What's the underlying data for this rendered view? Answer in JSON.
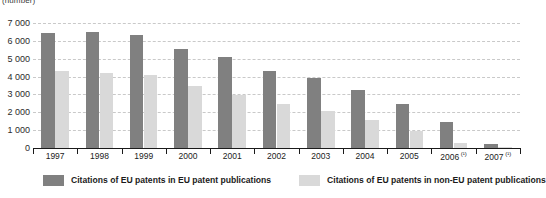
{
  "chart_data": {
    "type": "bar",
    "title": "",
    "subtitle": "",
    "unit_label": "(number)",
    "xlabel": "",
    "ylabel": "",
    "ylim": [
      0,
      7000
    ],
    "ytick_step": 1000,
    "yticks": [
      "0",
      "1 000",
      "2 000",
      "3 000",
      "4 000",
      "5 000",
      "6 000",
      "7 000"
    ],
    "grid": true,
    "grid_style": "dashed-horizontal",
    "legend_position": "bottom",
    "categories": [
      "1997",
      "1998",
      "1999",
      "2000",
      "2001",
      "2002",
      "2003",
      "2004",
      "2005",
      "2006",
      "2007"
    ],
    "category_labels": [
      {
        "text": "1997",
        "footnote": ""
      },
      {
        "text": "1998",
        "footnote": ""
      },
      {
        "text": "1999",
        "footnote": ""
      },
      {
        "text": "2000",
        "footnote": ""
      },
      {
        "text": "2001",
        "footnote": ""
      },
      {
        "text": "2002",
        "footnote": ""
      },
      {
        "text": "2003",
        "footnote": ""
      },
      {
        "text": "2004",
        "footnote": ""
      },
      {
        "text": "2005",
        "footnote": ""
      },
      {
        "text": "2006",
        "footnote": "(¹)"
      },
      {
        "text": "2007",
        "footnote": "(¹)"
      }
    ],
    "series": [
      {
        "name": "Citations of EU patents in EU patent publications",
        "color": "#808080",
        "values": [
          6450,
          6500,
          6350,
          5550,
          5100,
          4300,
          3900,
          3250,
          2450,
          1450,
          250
        ]
      },
      {
        "name": "Citations of EU patents in non-EU patent publications",
        "color": "#d9d9d9",
        "values": [
          4300,
          4200,
          4100,
          3450,
          2950,
          2450,
          2050,
          1550,
          950,
          280,
          40
        ]
      }
    ]
  },
  "legend": {
    "items": [
      {
        "label": "Citations of EU patents in EU patent publications",
        "color": "#808080"
      },
      {
        "label": "Citations of EU patents in non-EU patent publications",
        "color": "#d9d9d9"
      }
    ]
  },
  "colors": {
    "series_1": "#808080",
    "series_2": "#d9d9d9",
    "gridline": "#c9c9c9",
    "axis": "#1a1a1a",
    "text": "#222222",
    "background": "#ffffff"
  }
}
